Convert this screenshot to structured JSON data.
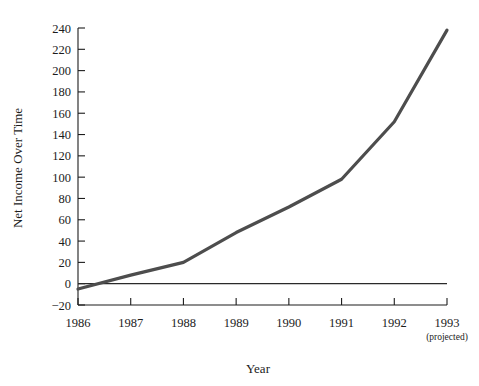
{
  "chart_data": {
    "type": "line",
    "title": "",
    "xlabel": "Year",
    "ylabel": "Net Income Over Time",
    "categories": [
      "1986",
      "1987",
      "1988",
      "1989",
      "1990",
      "1991",
      "1992",
      "1993"
    ],
    "x_tick_sublabels": [
      "",
      "",
      "",
      "",
      "",
      "",
      "",
      "(projected)"
    ],
    "y_ticks": [
      -20,
      0,
      20,
      40,
      60,
      80,
      100,
      120,
      140,
      160,
      180,
      200,
      220,
      240
    ],
    "y_tick_labels": [
      "−20",
      "0",
      "20",
      "40",
      "60",
      "80",
      "100",
      "120",
      "140",
      "160",
      "180",
      "200",
      "220",
      "240"
    ],
    "ylim": [
      -28,
      248
    ],
    "xlim": [
      1986,
      1993
    ],
    "grid": false,
    "legend": false,
    "reference_lines": [
      {
        "name": "zero-line",
        "axis": "y",
        "value": 0,
        "color": "#2a2a2a"
      }
    ],
    "series": [
      {
        "name": "Net Income",
        "color": "#4d4d4d",
        "line_width": 3.2,
        "x": [
          1986,
          1987,
          1988,
          1989,
          1990,
          1991,
          1992,
          1993
        ],
        "values": [
          -5,
          8,
          20,
          48,
          72,
          98,
          152,
          238
        ]
      }
    ],
    "annotations": []
  },
  "axes": {
    "y_title": "Net Income Over Time",
    "x_title": "Year",
    "projected_note": "(projected)"
  }
}
